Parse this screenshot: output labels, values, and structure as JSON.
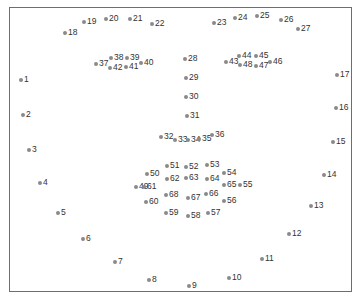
{
  "figure": {
    "type": "facial-landmark-diagram",
    "caption": "",
    "marker_color": "#8a8a8a",
    "label_color": "#333333",
    "frame_color": "#6e6e6e"
  },
  "landmarks": [
    {
      "id": "1",
      "x": 21,
      "y": 80
    },
    {
      "id": "2",
      "x": 23,
      "y": 115
    },
    {
      "id": "3",
      "x": 29,
      "y": 150
    },
    {
      "id": "4",
      "x": 40,
      "y": 183
    },
    {
      "id": "5",
      "x": 58,
      "y": 213
    },
    {
      "id": "6",
      "x": 83,
      "y": 239
    },
    {
      "id": "7",
      "x": 115,
      "y": 262
    },
    {
      "id": "8",
      "x": 149,
      "y": 280
    },
    {
      "id": "9",
      "x": 189,
      "y": 286
    },
    {
      "id": "10",
      "x": 229,
      "y": 278
    },
    {
      "id": "11",
      "x": 262,
      "y": 259
    },
    {
      "id": "12",
      "x": 289,
      "y": 234
    },
    {
      "id": "13",
      "x": 311,
      "y": 206
    },
    {
      "id": "14",
      "x": 324,
      "y": 175
    },
    {
      "id": "15",
      "x": 333,
      "y": 142
    },
    {
      "id": "16",
      "x": 336,
      "y": 108
    },
    {
      "id": "17",
      "x": 337,
      "y": 75
    },
    {
      "id": "18",
      "x": 65,
      "y": 33
    },
    {
      "id": "19",
      "x": 84,
      "y": 22
    },
    {
      "id": "20",
      "x": 106,
      "y": 19
    },
    {
      "id": "21",
      "x": 130,
      "y": 19
    },
    {
      "id": "22",
      "x": 152,
      "y": 24
    },
    {
      "id": "23",
      "x": 214,
      "y": 23
    },
    {
      "id": "24",
      "x": 235,
      "y": 18
    },
    {
      "id": "25",
      "x": 257,
      "y": 16
    },
    {
      "id": "26",
      "x": 281,
      "y": 20
    },
    {
      "id": "27",
      "x": 298,
      "y": 29
    },
    {
      "id": "28",
      "x": 185,
      "y": 59
    },
    {
      "id": "29",
      "x": 186,
      "y": 78
    },
    {
      "id": "30",
      "x": 186,
      "y": 97
    },
    {
      "id": "31",
      "x": 187,
      "y": 116
    },
    {
      "id": "32",
      "x": 161,
      "y": 137
    },
    {
      "id": "33",
      "x": 175,
      "y": 140
    },
    {
      "id": "34",
      "x": 188,
      "y": 140
    },
    {
      "id": "35",
      "x": 199,
      "y": 139
    },
    {
      "id": "36",
      "x": 212,
      "y": 135
    },
    {
      "id": "37",
      "x": 96,
      "y": 64
    },
    {
      "id": "38",
      "x": 111,
      "y": 58
    },
    {
      "id": "39",
      "x": 127,
      "y": 58
    },
    {
      "id": "40",
      "x": 141,
      "y": 63
    },
    {
      "id": "41",
      "x": 126,
      "y": 67
    },
    {
      "id": "42",
      "x": 110,
      "y": 68
    },
    {
      "id": "43",
      "x": 226,
      "y": 62
    },
    {
      "id": "44",
      "x": 239,
      "y": 56
    },
    {
      "id": "45",
      "x": 256,
      "y": 56
    },
    {
      "id": "46",
      "x": 270,
      "y": 62
    },
    {
      "id": "47",
      "x": 256,
      "y": 66
    },
    {
      "id": "48",
      "x": 240,
      "y": 65
    },
    {
      "id": "49",
      "x": 136,
      "y": 187
    },
    {
      "id": "50",
      "x": 147,
      "y": 174
    },
    {
      "id": "51",
      "x": 167,
      "y": 166
    },
    {
      "id": "52",
      "x": 186,
      "y": 167
    },
    {
      "id": "53",
      "x": 207,
      "y": 165
    },
    {
      "id": "54",
      "x": 224,
      "y": 173
    },
    {
      "id": "55",
      "x": 240,
      "y": 185
    },
    {
      "id": "56",
      "x": 224,
      "y": 201
    },
    {
      "id": "57",
      "x": 208,
      "y": 213
    },
    {
      "id": "58",
      "x": 188,
      "y": 216
    },
    {
      "id": "59",
      "x": 166,
      "y": 213
    },
    {
      "id": "60",
      "x": 146,
      "y": 202
    },
    {
      "id": "61",
      "x": 144,
      "y": 187
    },
    {
      "id": "62",
      "x": 167,
      "y": 179
    },
    {
      "id": "63",
      "x": 186,
      "y": 178
    },
    {
      "id": "64",
      "x": 207,
      "y": 179
    },
    {
      "id": "65",
      "x": 224,
      "y": 185
    },
    {
      "id": "66",
      "x": 206,
      "y": 194
    },
    {
      "id": "67",
      "x": 188,
      "y": 198
    },
    {
      "id": "68",
      "x": 166,
      "y": 195
    }
  ]
}
